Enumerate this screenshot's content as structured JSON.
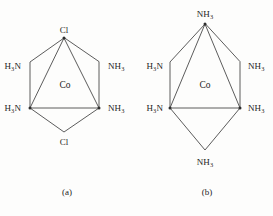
{
  "figure": {
    "background_color": "#fdfdfc",
    "bond_color": "#4a4a4a",
    "text_color": "#1d1d1d"
  },
  "structures": [
    {
      "id": "a",
      "caption": "(a)",
      "metal": "Co",
      "caption_position": {
        "x": 67,
        "y": 192
      },
      "metal_position": {
        "x": 65,
        "y": 86
      },
      "ligands": [
        {
          "name": "chloro-top",
          "label_html": "Cl",
          "text": "Cl",
          "position": {
            "x": 64,
            "y": 30
          },
          "anchor": "center"
        },
        {
          "name": "ammine-upper-left",
          "label_html": "H<sub>3</sub>N",
          "text": "H3N",
          "position": {
            "x": 21,
            "y": 66
          },
          "anchor": "right"
        },
        {
          "name": "ammine-upper-right",
          "label_html": "NH<sub>3</sub>",
          "text": "NH3",
          "position": {
            "x": 108,
            "y": 66
          },
          "anchor": "left"
        },
        {
          "name": "ammine-lower-left",
          "label_html": "H<sub>3</sub>N",
          "text": "H3N",
          "position": {
            "x": 21,
            "y": 108
          },
          "anchor": "right"
        },
        {
          "name": "ammine-lower-right",
          "label_html": "NH<sub>3</sub>",
          "text": "NH3",
          "position": {
            "x": 108,
            "y": 108
          },
          "anchor": "left"
        },
        {
          "name": "chloro-bottom",
          "label_html": "Cl",
          "text": "Cl",
          "position": {
            "x": 64,
            "y": 142
          },
          "anchor": "center"
        }
      ]
    },
    {
      "id": "b",
      "caption": "(b)",
      "metal": "Co",
      "caption_position": {
        "x": 207,
        "y": 192
      },
      "metal_position": {
        "x": 205,
        "y": 86
      },
      "ligands": [
        {
          "name": "ammine-top",
          "label_html": "NH<sub>3</sub>",
          "text": "NH3",
          "position": {
            "x": 205,
            "y": 14
          },
          "anchor": "center"
        },
        {
          "name": "ammine-upper-left",
          "label_html": "H<sub>3</sub>N",
          "text": "H3N",
          "position": {
            "x": 163,
            "y": 66
          },
          "anchor": "right"
        },
        {
          "name": "ammine-upper-right",
          "label_html": "NH<sub>3</sub>",
          "text": "NH3",
          "position": {
            "x": 248,
            "y": 66
          },
          "anchor": "left"
        },
        {
          "name": "ammine-lower-left",
          "label_html": "H<sub>3</sub>N",
          "text": "H3N",
          "position": {
            "x": 163,
            "y": 108
          },
          "anchor": "right"
        },
        {
          "name": "ammine-lower-right",
          "label_html": "NH<sub>3</sub>",
          "text": "NH3",
          "position": {
            "x": 248,
            "y": 108
          },
          "anchor": "left"
        },
        {
          "name": "ammine-bottom",
          "label_html": "NH<sub>3</sub>",
          "text": "NH3",
          "position": {
            "x": 205,
            "y": 162
          },
          "anchor": "center"
        }
      ]
    }
  ]
}
